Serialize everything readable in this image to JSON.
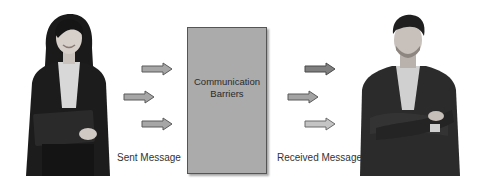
{
  "diagram": {
    "sender": {
      "label": "Sent Message",
      "figure": "woman-with-clipboard"
    },
    "barrier_box": {
      "line1": "Communication",
      "line2": "Barriers",
      "fill": "#ababab",
      "border": "#555555"
    },
    "receiver": {
      "label": "Received Message",
      "figure": "man-arms-crossed"
    },
    "sent_arrows": [
      {
        "color": "#a6a6a6"
      },
      {
        "color": "#a6a6a6"
      },
      {
        "color": "#a6a6a6"
      }
    ],
    "received_arrows": [
      {
        "color": "#7f7f7f"
      },
      {
        "color": "#a3a3a3"
      },
      {
        "color": "#c4c4c4"
      }
    ]
  }
}
